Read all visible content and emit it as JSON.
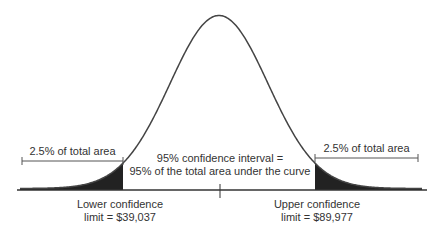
{
  "chart_data": {
    "type": "area",
    "title": "",
    "distribution": "normal",
    "confidence_level": "95%",
    "lower_tail_area": "2.5%",
    "upper_tail_area": "2.5%",
    "lower_limit": 39037,
    "upper_limit": 89977,
    "annotations": {
      "left_tail": "2.5% of total area",
      "right_tail": "2.5% of total area",
      "center_line1": "95% confidence interval =",
      "center_line2": "95% of the total area under the curve",
      "lower_line1": "Lower confidence",
      "lower_line2": "limit = $39,037",
      "upper_line1": "Upper confidence",
      "upper_line2": "limit = $89,977"
    },
    "colors": {
      "curve": "#444444",
      "tail_fill": "#222222",
      "axis": "#333333"
    }
  }
}
